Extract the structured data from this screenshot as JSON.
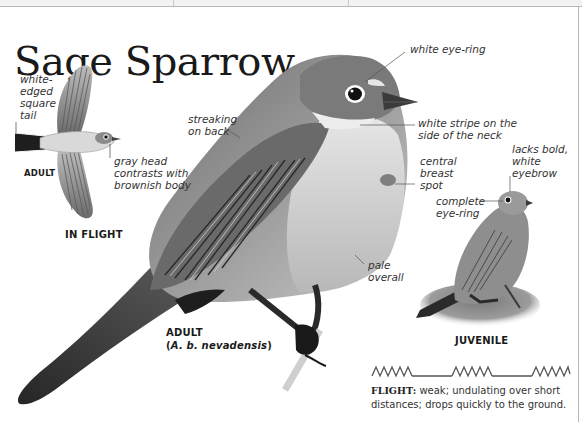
{
  "species": {
    "title": "Sage Sparrow"
  },
  "in_flight": {
    "caption": "IN FLIGHT",
    "age_label": "ADULT",
    "annotations": {
      "tail": "white-\nedged\nsquare\ntail",
      "head": "gray head\ncontrasts with\nbrownish body"
    }
  },
  "adult": {
    "caption": "ADULT",
    "subspecies_open": "(",
    "subspecies": "A. b. nevadensis",
    "subspecies_close": ")",
    "annotations": {
      "eye_ring": "white eye-ring",
      "back": "streaking\non back",
      "neck": "white stripe on the\nside of the neck",
      "breast": "central\nbreast\nspot",
      "overall": "pale\noverall"
    }
  },
  "juvenile": {
    "caption": "JUVENILE",
    "annotations": {
      "eyebrow": "lacks bold,\nwhite\neyebrow",
      "eye_ring": "complete\neye-ring"
    }
  },
  "flight": {
    "pattern_icon": "undulating-flight-pattern-icon",
    "heading": "FLIGHT:",
    "description": " weak; undulating over short distances; drops quickly to the ground."
  }
}
